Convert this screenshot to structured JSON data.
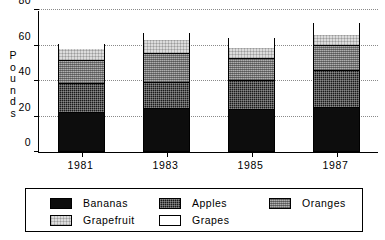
{
  "chart_data": {
    "type": "bar",
    "subtype": "stacked",
    "title": "",
    "xlabel": "",
    "ylabel": "Pounds",
    "categories": [
      "1981",
      "1983",
      "1985",
      "1987"
    ],
    "ylim": [
      0,
      80
    ],
    "yticks": [
      0,
      20,
      40,
      60,
      80
    ],
    "ytick_labels": [
      "0",
      "20",
      "40",
      "60",
      "80"
    ],
    "grid": true,
    "grid_axis": "y",
    "legend_position": "bottom",
    "series": [
      {
        "name": "Bananas",
        "color": "#0d0d0d",
        "pattern": "solid-black",
        "values": [
          22,
          24,
          23.5,
          25
        ]
      },
      {
        "name": "Apples",
        "color": "#1a1a1a",
        "pattern": "dark-crosshatch",
        "values": [
          16.5,
          15,
          16.5,
          20.5
        ]
      },
      {
        "name": "Oranges",
        "color": "#8c8c8c",
        "pattern": "medium-gray-dither",
        "values": [
          12.5,
          16,
          12.5,
          14
        ]
      },
      {
        "name": "Grapefruit",
        "color": "#dcdcdc",
        "pattern": "light-gray-dither",
        "values": [
          7,
          8,
          6,
          6.5
        ]
      },
      {
        "name": "Grapes",
        "color": "#ffffff",
        "pattern": "white",
        "values": [
          3,
          4,
          6,
          6.5
        ]
      }
    ],
    "totals": [
      61,
      67,
      64.5,
      72.5
    ]
  },
  "legend": {
    "rows": [
      [
        "Bananas",
        "Apples",
        "Oranges"
      ],
      [
        "Grapefruit",
        "Grapes"
      ]
    ]
  },
  "axis": {
    "y_label_letters": [
      "P",
      "o",
      "u",
      "n",
      "d",
      "s"
    ]
  }
}
